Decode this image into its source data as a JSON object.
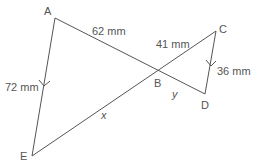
{
  "diagram": {
    "type": "similar-triangles",
    "colors": {
      "line": "#555555",
      "text": "#555555",
      "background": "#ffffff"
    },
    "points": {
      "A": {
        "label": "A",
        "x": 55,
        "y": 18
      },
      "B": {
        "label": "B",
        "x": 156,
        "y": 70
      },
      "C": {
        "label": "C",
        "x": 216,
        "y": 31
      },
      "D": {
        "label": "D",
        "x": 205,
        "y": 94
      },
      "E": {
        "label": "E",
        "x": 32,
        "y": 156
      }
    },
    "segments": [
      {
        "from": "A",
        "to": "B",
        "label": "62 mm"
      },
      {
        "from": "A",
        "to": "E",
        "label": "72 mm",
        "parallel_marker": true
      },
      {
        "from": "B",
        "to": "C",
        "label": "41 mm"
      },
      {
        "from": "C",
        "to": "D",
        "label": "36 mm",
        "parallel_marker": true
      },
      {
        "from": "B",
        "to": "D",
        "label": "y"
      },
      {
        "from": "B",
        "to": "E",
        "label": "x"
      }
    ],
    "labels": {
      "AB": "62 mm",
      "AE": "72 mm",
      "BC": "41 mm",
      "CD": "36 mm",
      "BD": "y",
      "BE": "x"
    }
  }
}
